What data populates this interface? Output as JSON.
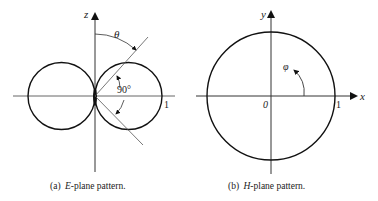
{
  "panels": [
    {
      "id": "a",
      "caption_prefix": "(a)",
      "caption_italic": "E",
      "caption_rest": "-plane pattern.",
      "axis_label": "z",
      "angle_label": "θ",
      "angle_value": "90°",
      "unit_mark": "1"
    },
    {
      "id": "b",
      "caption_prefix": "(b)",
      "caption_italic": "H",
      "caption_rest": "-plane pattern.",
      "x_axis_label": "x",
      "y_axis_label": "y",
      "angle_label": "φ",
      "origin_label": "0",
      "unit_mark": "1"
    }
  ],
  "colors": {
    "stroke": "#111111",
    "thin_line": "#555555"
  }
}
